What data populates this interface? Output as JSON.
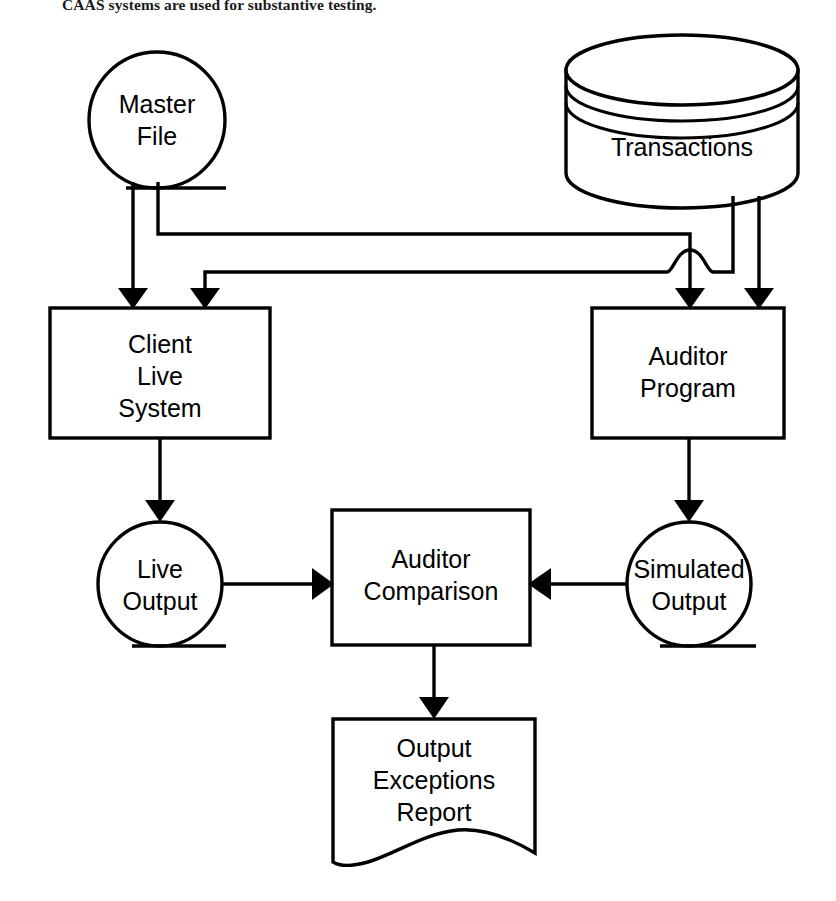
{
  "caption": {
    "text": "CAAS systems are used for substantive testing."
  },
  "diagram": {
    "title": "CAAS substantive testing parallel simulation flowchart",
    "colors": {
      "stroke": "#000000",
      "fill": "#ffffff",
      "text": "#000000"
    },
    "nodes": [
      {
        "id": "master-file",
        "shape": "magnetic-tape-circle",
        "lines": [
          "Master",
          "File"
        ]
      },
      {
        "id": "transactions",
        "shape": "database-cylinder",
        "lines": [
          "Transactions"
        ]
      },
      {
        "id": "client-live-system",
        "shape": "process-box",
        "lines": [
          "Client",
          "Live",
          "System"
        ]
      },
      {
        "id": "auditor-program",
        "shape": "process-box",
        "lines": [
          "Auditor",
          "Program"
        ]
      },
      {
        "id": "live-output",
        "shape": "magnetic-tape-circle",
        "lines": [
          "Live",
          "Output"
        ]
      },
      {
        "id": "auditor-comparison",
        "shape": "process-box",
        "lines": [
          "Auditor",
          "Comparison"
        ]
      },
      {
        "id": "simulated-output",
        "shape": "magnetic-tape-circle",
        "lines": [
          "Simulated",
          "Output"
        ]
      },
      {
        "id": "output-exceptions-report",
        "shape": "document",
        "lines": [
          "Output",
          "Exceptions",
          "Report"
        ]
      }
    ],
    "edges": [
      {
        "id": "master-to-client",
        "from": "master-file",
        "to": "client-live-system"
      },
      {
        "id": "master-to-auditor",
        "from": "master-file",
        "to": "auditor-program"
      },
      {
        "id": "transactions-to-client",
        "from": "transactions",
        "to": "client-live-system"
      },
      {
        "id": "transactions-to-auditor",
        "from": "transactions",
        "to": "auditor-program"
      },
      {
        "id": "client-to-live-output",
        "from": "client-live-system",
        "to": "live-output"
      },
      {
        "id": "auditor-to-simulated-output",
        "from": "auditor-program",
        "to": "simulated-output"
      },
      {
        "id": "live-output-to-comparison",
        "from": "live-output",
        "to": "auditor-comparison"
      },
      {
        "id": "simulated-output-to-comparison",
        "from": "simulated-output",
        "to": "auditor-comparison"
      },
      {
        "id": "comparison-to-report",
        "from": "auditor-comparison",
        "to": "output-exceptions-report"
      }
    ]
  }
}
